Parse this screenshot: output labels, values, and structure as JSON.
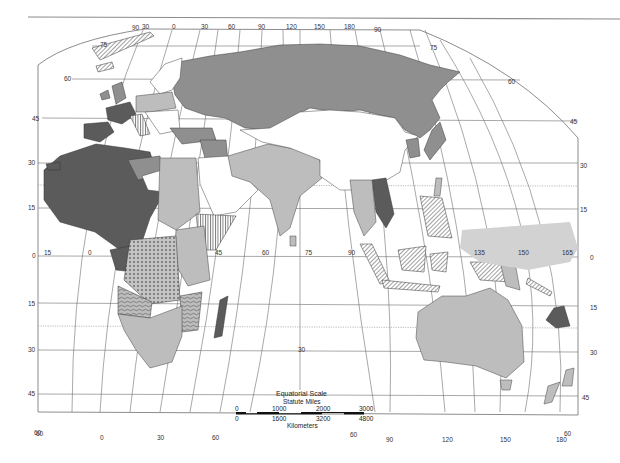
{
  "map": {
    "title": "",
    "region": "Eastern Hemisphere",
    "colors": {
      "category_darkest": "#5b5b5b",
      "category_mid": "#8f8f8f",
      "category_light": "#bdbdbd",
      "category_pacific_region": "#d2d2d2",
      "background": "#ffffff",
      "graticule": "#6e6e6e"
    },
    "fill_categories": [
      {
        "id": "darkest",
        "example_regions": [
          "Iberia",
          "France",
          "Northwest Africa",
          "Sahel",
          "Indochina",
          "Madagascar",
          "New Caledonia"
        ]
      },
      {
        "id": "mid",
        "example_regions": [
          "Russia / Siberia",
          "Anatolia",
          "Levant",
          "Japan",
          "Korea"
        ]
      },
      {
        "id": "light",
        "example_regions": [
          "Central Europe",
          "Egypt / Sudan",
          "East Africa",
          "Southern Africa",
          "South Asia",
          "Australia",
          "New Zealand"
        ]
      },
      {
        "id": "white",
        "example_regions": [
          "Scandinavia",
          "Southern Europe",
          "Arabia",
          "China",
          "Mongolia",
          "Central Asia"
        ]
      },
      {
        "id": "diagonal-hatch",
        "example_regions": [
          "Indonesia",
          "Philippines",
          "Borneo",
          "New Guinea",
          "Svalbard"
        ]
      },
      {
        "id": "vertical-hatch",
        "example_regions": [
          "Italy",
          "Libya coast",
          "Horn of Africa"
        ]
      },
      {
        "id": "dotted",
        "example_regions": [
          "Congo Basin"
        ]
      },
      {
        "id": "wavy",
        "example_regions": [
          "Angola",
          "Mozambique"
        ]
      },
      {
        "id": "pacific-shaded",
        "example_regions": [
          "Micronesia region"
        ]
      }
    ],
    "graticule": {
      "top_longitudes": [
        "90",
        "30",
        "0",
        "30",
        "60",
        "90",
        "120",
        "150",
        "180",
        "90"
      ],
      "equator_longitudes": [
        "15",
        "0",
        "45",
        "60",
        "75",
        "90",
        "135",
        "150",
        "165"
      ],
      "bottom_longitudes": [
        "60",
        "0",
        "30",
        "60",
        "60",
        "90",
        "120",
        "150",
        "180",
        "60"
      ],
      "left_latitudes": [
        "75",
        "60",
        "45",
        "30",
        "15",
        "0",
        "15",
        "30",
        "45",
        "60"
      ],
      "right_latitudes": [
        "75",
        "60",
        "45",
        "30",
        "15",
        "0",
        "15",
        "30",
        "45"
      ],
      "interior_labels": [
        "30"
      ]
    },
    "scale": {
      "title": "Equatorial Scale",
      "miles_label": "Statute Miles",
      "miles_ticks": [
        "0",
        "1000",
        "2000",
        "3000"
      ],
      "km_ticks": [
        "0",
        "1600",
        "3200",
        "4800"
      ],
      "km_label": "Kilometers"
    }
  }
}
